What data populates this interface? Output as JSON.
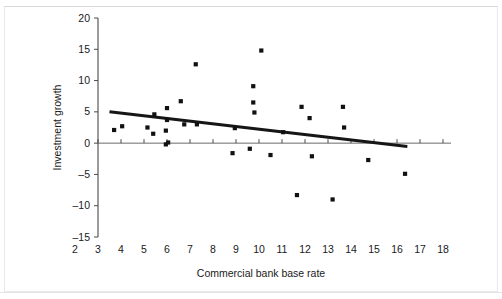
{
  "chart_data": {
    "type": "scatter",
    "title": "",
    "xlabel": "Commercial bank base rate",
    "ylabel": "Investment growth",
    "xlim": [
      2,
      18
    ],
    "ylim": [
      -15,
      20
    ],
    "xticks": [
      2,
      3,
      4,
      5,
      6,
      7,
      8,
      9,
      10,
      11,
      12,
      13,
      14,
      15,
      16,
      17,
      18
    ],
    "xtick_labels": [
      "2",
      "3",
      "4",
      "5",
      "6",
      "7",
      "8",
      "9",
      "10",
      "11",
      "12",
      "13",
      "14",
      "15",
      "16",
      "17",
      "18"
    ],
    "yticks": [
      -15,
      -10,
      -5,
      0,
      5,
      10,
      15,
      20
    ],
    "ytick_labels": [
      "–15",
      "–10",
      "–5",
      "0",
      "5",
      "10",
      "15",
      "20"
    ],
    "grid": false,
    "legend": null,
    "marker": "square",
    "marker_color": "#111111",
    "points": [
      {
        "x": 3.7,
        "y": 2.1
      },
      {
        "x": 4.05,
        "y": 2.7
      },
      {
        "x": 5.15,
        "y": 2.5
      },
      {
        "x": 5.4,
        "y": 1.5
      },
      {
        "x": 5.45,
        "y": 4.6
      },
      {
        "x": 5.95,
        "y": 2.0
      },
      {
        "x": 5.95,
        "y": -0.2
      },
      {
        "x": 6.0,
        "y": 3.7
      },
      {
        "x": 6.0,
        "y": 5.6
      },
      {
        "x": 6.05,
        "y": 0.1
      },
      {
        "x": 6.6,
        "y": 6.7
      },
      {
        "x": 6.75,
        "y": 3.0
      },
      {
        "x": 7.25,
        "y": 12.6
      },
      {
        "x": 7.3,
        "y": 3.0
      },
      {
        "x": 8.85,
        "y": -1.6
      },
      {
        "x": 8.95,
        "y": 2.4
      },
      {
        "x": 9.6,
        "y": -0.9
      },
      {
        "x": 9.75,
        "y": 9.1
      },
      {
        "x": 9.75,
        "y": 6.5
      },
      {
        "x": 9.8,
        "y": 4.9
      },
      {
        "x": 10.1,
        "y": 14.8
      },
      {
        "x": 10.5,
        "y": -1.9
      },
      {
        "x": 11.05,
        "y": 1.75
      },
      {
        "x": 11.65,
        "y": -8.3
      },
      {
        "x": 11.85,
        "y": 5.8
      },
      {
        "x": 12.2,
        "y": 4.0
      },
      {
        "x": 12.3,
        "y": -2.1
      },
      {
        "x": 13.2,
        "y": -9.0
      },
      {
        "x": 13.65,
        "y": 5.8
      },
      {
        "x": 13.7,
        "y": 2.5
      },
      {
        "x": 14.75,
        "y": -2.7
      },
      {
        "x": 16.35,
        "y": -4.9
      }
    ],
    "trend_line": {
      "color": "#161616",
      "x_start": 3.5,
      "y_start": 5.0,
      "x_end": 16.45,
      "y_end": -0.55
    }
  }
}
